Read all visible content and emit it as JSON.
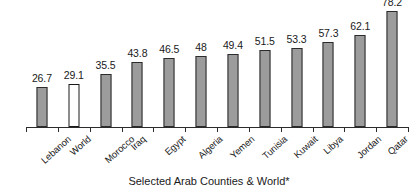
{
  "chart_data": {
    "type": "bar",
    "title": "",
    "subtitle": "",
    "xlabel": "Selected Arab Counties & World*",
    "ylabel": "",
    "ylim": [
      0,
      80
    ],
    "grid": false,
    "legend": "none",
    "value_labels": true,
    "categories": [
      "Lebanon",
      "World",
      "Morocco",
      "Iraq",
      "Egypt",
      "Algeria",
      "Yemen",
      "Tunisia",
      "Kuwait",
      "Libya",
      "Jordan",
      "Qatar"
    ],
    "values": [
      26.7,
      29.1,
      35.5,
      43.8,
      46.5,
      48,
      49.4,
      51.5,
      53.3,
      57.3,
      62.1,
      78.2
    ],
    "value_text": [
      "26.7",
      "29.1",
      "35.5",
      "43.8",
      "46.5",
      "48",
      "49.4",
      "51.5",
      "53.3",
      "57.3",
      "62.1",
      "78.2"
    ],
    "bar_styles": [
      "filled",
      "outline",
      "filled",
      "filled",
      "filled",
      "filled",
      "filled",
      "filled",
      "filled",
      "filled",
      "filled",
      "filled"
    ],
    "colors": {
      "bar_fill": "#9c9c9c",
      "bar_outline": "#2b2b2b",
      "highlight_fill": "#ffffff",
      "axis": "#2b2b2b",
      "text": "#1a1a1a",
      "background": "#ffffff"
    }
  }
}
